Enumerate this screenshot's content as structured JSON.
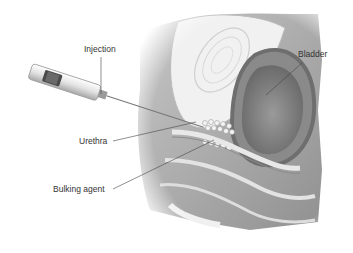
{
  "figure": {
    "labels": {
      "injection": "Injection",
      "bladder": "Bladder",
      "urethra": "Urethra",
      "bulking_agent": "Bulking agent"
    }
  }
}
